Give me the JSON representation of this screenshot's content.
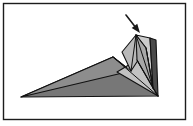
{
  "figure": {
    "canvas": {
      "width": 193,
      "height": 126,
      "background": "#ffffff"
    },
    "frame": {
      "name": "figure-border",
      "x": 3.5,
      "y": 3.5,
      "width": 182,
      "height": 116,
      "stroke": "#1c1c1c",
      "stroke_width": 1.4,
      "fill": "#ffffff"
    },
    "palette": {
      "paper_dark": "#777777",
      "paper_mid": "#8d8d8d",
      "paper_light": "#b9b9b9",
      "paper_lightest": "#c9c9c9",
      "edge_stroke": "#111111",
      "arrow": "#1a1a1a",
      "background": "#ffffff"
    },
    "shapes": [
      {
        "name": "base-wedge-lower",
        "role": "large flat wedge forming the body of the model",
        "fill": "#777777",
        "points": "21,97 113,57 158,96"
      },
      {
        "name": "base-wedge-upper-left",
        "role": "upper folded plane sloping from the left tip to the apex",
        "fill": "#8d8d8d",
        "points": "21,97 113,57 131,71"
      },
      {
        "name": "lower-right-flap",
        "role": "small light flap below the raised point",
        "fill": "#c2c2c2",
        "points": "117,72 137,60 158,96"
      },
      {
        "name": "raised-point-left-face",
        "role": "left face of the raised folded point",
        "fill": "#b9b9b9",
        "points": "122,52 136,35 146,48 131,71"
      },
      {
        "name": "raised-point-right-face",
        "role": "right lighter face of the raised folded point",
        "fill": "#cccccc",
        "points": "136,35 150,38 153,88 146,48"
      },
      {
        "name": "raised-point-inner-wedge",
        "role": "inner shaded wedge between folds",
        "fill": "#a8a8a8",
        "points": "136,35 146,48 153,88 137,60"
      },
      {
        "name": "right-edge-spine",
        "role": "dark vertical spine at the right edge of the model",
        "fill": "#4a4a4a",
        "points": "150,38 156,40 158,96 153,88"
      }
    ],
    "fold_lines": [
      {
        "name": "fold-apex-to-right-base",
        "x1": 113,
        "y1": 57,
        "x2": 158,
        "y2": 96
      },
      {
        "name": "fold-apex-to-flap",
        "x1": 113,
        "y1": 57,
        "x2": 131,
        "y2": 71
      },
      {
        "name": "fold-point-center",
        "x1": 136,
        "y1": 35,
        "x2": 153,
        "y2": 88
      },
      {
        "name": "fold-point-left",
        "x1": 136,
        "y1": 35,
        "x2": 131,
        "y2": 71
      },
      {
        "name": "fold-flap-diagonal",
        "x1": 137,
        "y1": 60,
        "x2": 158,
        "y2": 96
      },
      {
        "name": "fold-crease-short",
        "x1": 146,
        "y1": 48,
        "x2": 153,
        "y2": 88
      }
    ],
    "arrow": {
      "name": "fold-direction-arrow",
      "description": "solid arrow pointing down-right toward the raised point",
      "start_x": 126,
      "start_y": 15,
      "end_x": 140,
      "end_y": 33,
      "shaft_width": 1.6,
      "head_length": 9,
      "head_width": 7,
      "color": "#1a1a1a"
    }
  },
  "labels": {
    "figure_alt": "Diagram of a partially folded paper model with an arrow indicating the next fold direction."
  }
}
